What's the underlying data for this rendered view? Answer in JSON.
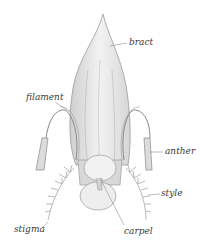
{
  "diagram": {
    "labels": {
      "bract": "bract",
      "filament": "filament",
      "anther": "anther",
      "style": "style",
      "stigma": "stigma",
      "carpel": "carpel"
    },
    "colors": {
      "background": "#ffffff",
      "line": "#8a8a8a",
      "fill": "#e4e4e4",
      "label": "#3a3a3a"
    }
  }
}
